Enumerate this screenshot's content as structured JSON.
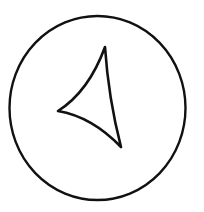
{
  "figure": {
    "width": 204,
    "height": 212,
    "background": "#ffffff",
    "stroke_color": "#111111",
    "circle": {
      "cx": 97.5,
      "cy": 108,
      "rx": 88,
      "ry": 92,
      "stroke_width": 2.4
    },
    "arrow": {
      "shape": "curved-triangle",
      "direction": "left",
      "vertices": [
        {
          "x": 105,
          "y": 47
        },
        {
          "x": 58,
          "y": 111
        },
        {
          "x": 121,
          "y": 147
        }
      ],
      "stroke_width": 2.6
    }
  }
}
